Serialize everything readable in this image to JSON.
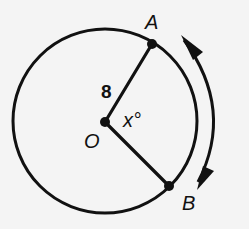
{
  "diagram": {
    "type": "circle-central-angle",
    "colors": {
      "background": "#f4f4f4",
      "ink": "#111111"
    },
    "circle": {
      "center_label": "O",
      "cx": 105,
      "cy": 121,
      "r": 92
    },
    "points": {
      "A": {
        "label": "A",
        "x": 152,
        "y": 44
      },
      "B": {
        "label": "B",
        "x": 169,
        "y": 186
      }
    },
    "radius_label": "8",
    "angle_label": "x°",
    "arc_arrow": {
      "description": "double-headed arrow along arc AB",
      "from": "A",
      "to": "B"
    }
  }
}
